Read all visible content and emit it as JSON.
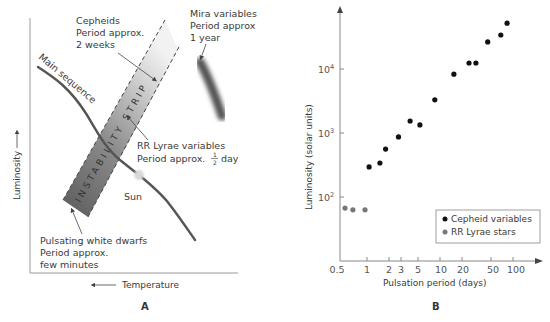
{
  "panel_a": {
    "letter": "A",
    "y_axis_label": "Luminosity",
    "x_axis_label": "Temperature",
    "main_sequence_label": "Main sequence",
    "strip_label": "INSTABILITY STRIP",
    "sun_label": "Sun",
    "cepheids": {
      "line1": "Cepheids",
      "line2": "Period approx.",
      "line3": "2 weeks"
    },
    "mira": {
      "line1": "Mira variables",
      "line2": "Period approx",
      "line3": "1 year"
    },
    "rr_lyrae": {
      "line1": "RR Lyrae variables",
      "line2": "Period approx.",
      "frac_num": "1",
      "frac_den": "2",
      "line2_end": "day"
    },
    "white_dwarfs": {
      "line1": "Pulsating white dwarfs",
      "line2": "Period approx.",
      "line3": "few minutes"
    }
  },
  "panel_b": {
    "letter": "B",
    "y_axis_label": "Luminosity (solar units)",
    "x_axis_label": "Pulsation period (days)",
    "y_ticks": [
      {
        "base": "10",
        "exp": "2"
      },
      {
        "base": "10",
        "exp": "3"
      },
      {
        "base": "10",
        "exp": "4"
      }
    ],
    "x_ticks": [
      "0.5",
      "1",
      "2",
      "3",
      "5",
      "10",
      "20",
      "50",
      "100"
    ],
    "legend": {
      "cepheid": "Cepheid variables",
      "rr_lyrae": "RR Lyrae stars"
    }
  },
  "colors": {
    "cepheid": "#111111",
    "rr_lyrae": "#777777",
    "axis": "#888888",
    "main_sequence": "#555555",
    "sun": "#d8d8d8"
  },
  "chart_data": [
    {
      "type": "diagram",
      "title": "Hertzsprung-Russell diagram with instability strip",
      "xlabel": "Temperature (decreasing to the right)",
      "ylabel": "Luminosity",
      "annotations": [
        "Main sequence",
        "INSTABILITY STRIP",
        "Sun",
        "Cepheids — Period approx. 2 weeks",
        "Mira variables — Period approx 1 year",
        "RR Lyrae variables — Period approx. 1/2 day",
        "Pulsating white dwarfs — Period approx. few minutes"
      ]
    },
    {
      "type": "scatter",
      "title": "",
      "xlabel": "Pulsation period (days)",
      "ylabel": "Luminosity (solar units)",
      "xscale": "log",
      "yscale": "log",
      "x_ticks": [
        0.5,
        1,
        2,
        3,
        5,
        10,
        20,
        50,
        100
      ],
      "y_ticks": [
        100,
        1000,
        10000
      ],
      "xlim": [
        0.45,
        200
      ],
      "ylim": [
        15,
        80000
      ],
      "legend_position": "lower right",
      "grid": false,
      "series": [
        {
          "name": "Cepheid variables",
          "points": [
            [
              1.07,
              295
            ],
            [
              1.5,
              340
            ],
            [
              1.8,
              560
            ],
            [
              2.7,
              870
            ],
            [
              3.9,
              1540
            ],
            [
              5.3,
              1340
            ],
            [
              8.5,
              3300
            ],
            [
              15.5,
              8300
            ],
            [
              25,
              12400
            ],
            [
              31,
              12400
            ],
            [
              45,
              26500
            ],
            [
              68,
              34000
            ],
            [
              83,
              52000
            ]
          ]
        },
        {
          "name": "RR Lyrae stars",
          "points": [
            [
              0.5,
              67
            ],
            [
              0.64,
              63
            ],
            [
              0.94,
              63
            ]
          ]
        }
      ]
    }
  ]
}
